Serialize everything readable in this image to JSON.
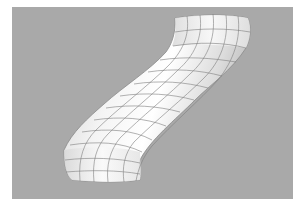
{
  "image": {
    "subject": "S-shaped swept tube surface with wireframe mesh",
    "background_color": "#a9a9a9",
    "surface_color": "#ececec",
    "mesh_line_color": "#7d7d7d"
  }
}
